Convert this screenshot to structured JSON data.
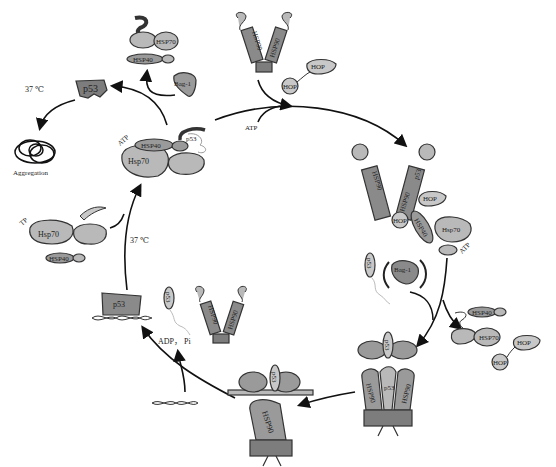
{
  "figure": {
    "colors": {
      "light_protein": "#b9b9b9",
      "mid_protein": "#9a9a9a",
      "dark_protein": "#7d7d7d",
      "outline": "#333333",
      "arrow": "#111111",
      "background": "#ffffff"
    }
  },
  "labels": {
    "temp_top_left": "37 ℃",
    "p53_misfolded": "p53",
    "aggregation": "Aggregation",
    "hsp70_top": "HSP70",
    "hsp40_top": "HSP40",
    "bag1_top": "Bag-1",
    "atp_complex_left": "ATP",
    "hsp40_complex_left": "HSP40",
    "hsp70_complex_left": "Hsp70",
    "p53_complex_left": "p53",
    "hsp90_top_a": "HSP90",
    "hsp90_top_b": "HSP90",
    "hop_top_a": "HOP",
    "hop_top_b": "HOP",
    "atp_top_arrow": "ATP",
    "hsp90_right_a": "HSP90",
    "hsp90_right_b": "HSP90",
    "p53_right": "p53",
    "hop_right_a": "HOP",
    "hop_right_b": "HOP",
    "hsp40_right": "HSP40",
    "hsp70_right": "Hsp70",
    "atp_right": "ATP",
    "p53_mid_right": "p53",
    "bag1_mid_right": "Bag-1",
    "hsp40_release": "HSP40",
    "hsp70_release": "HSP70",
    "hop_release_a": "HOP",
    "hop_release_b": "HOP",
    "hsp90_bottom_right_a": "HSP90",
    "hsp90_bottom_right_b": "HSP90",
    "p53_bottom_right": "p53",
    "p53_bottom_right_top": "p53",
    "hsp90_bottom_center": "HSP90",
    "p53_bottom_center": "p53",
    "adp_pi": "ADP， Pi",
    "p53_dna": "p53",
    "p53_free": "p53",
    "hsp90_free_a": "HSP90",
    "hsp90_free_b": "HSP90",
    "temp_left": "37 ℃",
    "tp_left": "TP",
    "hsp70_left": "Hsp70",
    "hsp40_left": "HSP40"
  }
}
